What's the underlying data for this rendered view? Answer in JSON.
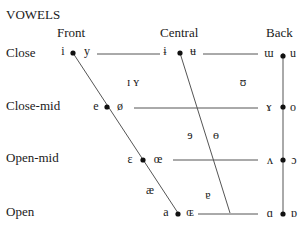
{
  "title": "VOWELS",
  "columns": {
    "front": "Front",
    "central": "Central",
    "back": "Back"
  },
  "rows": {
    "close": "Close",
    "close_mid": "Close-mid",
    "open_mid": "Open-mid",
    "open": "Open"
  },
  "vowels": {
    "close_front_unrounded": "i",
    "close_front_rounded": "y",
    "close_central_unrounded": "ɨ",
    "close_central_rounded": "ʉ",
    "close_back_unrounded": "ɯ",
    "close_back_rounded": "u",
    "near_close_front": "ɪ ʏ",
    "near_close_back": "ʊ",
    "close_mid_front_unrounded": "e",
    "close_mid_front_rounded": "ø",
    "close_mid_back_unrounded": "ɤ",
    "close_mid_back_rounded": "o",
    "mid_central_unrounded": "ɘ",
    "mid_central_rounded": "ɵ",
    "open_mid_front_unrounded": "ɛ",
    "open_mid_front_rounded": "œ",
    "open_mid_back_unrounded": "ʌ",
    "open_mid_back_rounded": "ɔ",
    "near_open_front": "æ",
    "near_open_central": "ɐ",
    "open_front_unrounded": "a",
    "open_front_rounded": "ɶ",
    "open_back_unrounded": "ɑ",
    "open_back_rounded": "ɒ"
  },
  "colors": {
    "line": "#555555",
    "dot": "#111111",
    "text": "#1a1a1a"
  }
}
